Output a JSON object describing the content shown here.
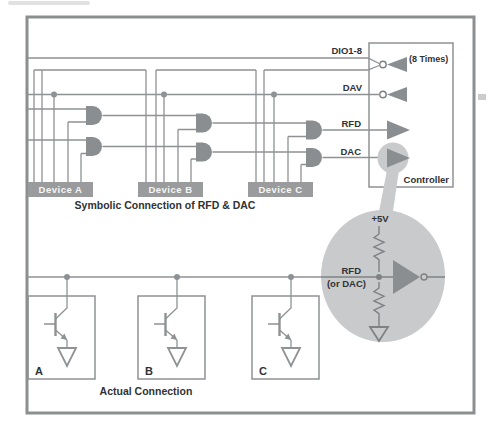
{
  "colors": {
    "line": "#8f9194",
    "shape_fill": "#8b8e90",
    "device_bar": "#9a9b9c",
    "highlight_gray": "#c9cacb",
    "label_text": "#303234",
    "device_bar_text": "#f6f6f6",
    "background": "#ffffff",
    "frame_border": "#8c8e90"
  },
  "symbolic": {
    "caption": "Symbolic Connection of RFD & DAC",
    "controller_label": "Controller",
    "signals": {
      "dio": "DIO1-8",
      "dio_note": "(8 Times)",
      "dav": "DAV",
      "rfd": "RFD",
      "dac": "DAC"
    },
    "devices": [
      {
        "label": "Device A"
      },
      {
        "label": "Device B"
      },
      {
        "label": "Device C"
      }
    ]
  },
  "magnifier": {
    "supply_label": "+5V",
    "signal_line1": "RFD",
    "signal_line2": "(or DAC)"
  },
  "actual": {
    "caption": "Actual Connection",
    "devices": [
      {
        "label": "A"
      },
      {
        "label": "B"
      },
      {
        "label": "C"
      }
    ]
  }
}
